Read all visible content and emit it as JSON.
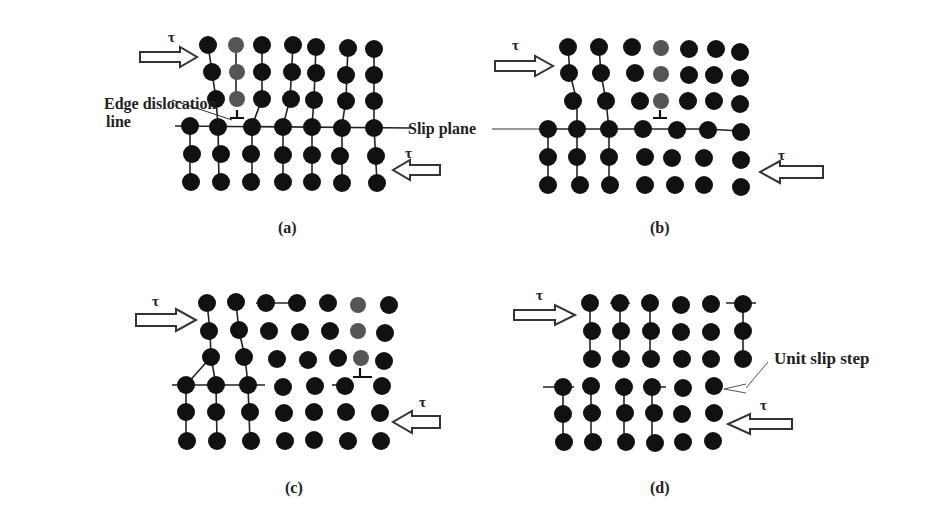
{
  "figure": {
    "labels": {
      "edge_dislocation_line_1": "Edge dislocation",
      "edge_dislocation_line_2": "line",
      "slip_plane": "Slip plane",
      "unit_slip_step": "Unit slip step",
      "tau": "τ"
    },
    "panels": [
      {
        "id": "a",
        "caption": "(a)"
      },
      {
        "id": "b",
        "caption": "(b)"
      },
      {
        "id": "c",
        "caption": "(c)"
      },
      {
        "id": "d",
        "caption": "(d)"
      }
    ]
  }
}
